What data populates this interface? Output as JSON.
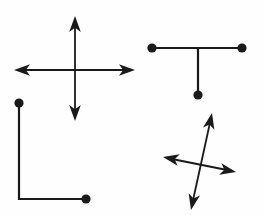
{
  "figure": {
    "title": "Four line-segment figures",
    "background_color": "#fefefe",
    "ink_color": "#1a1a1a",
    "width": 264,
    "height": 215,
    "shapes": [
      {
        "id": "double-arrow-cross",
        "name": "upright-cross-with-four-arrowheads",
        "position": "top-left",
        "stroke_width": 1.8,
        "segments": [
          {
            "name": "vertical-axis",
            "x1": 75,
            "y1": 20,
            "x2": 75,
            "y2": 117
          },
          {
            "name": "horizontal-axis",
            "x1": 18,
            "y1": 70,
            "x2": 131,
            "y2": 70
          }
        ],
        "arrowheads": [
          {
            "name": "arrow-up",
            "tip_x": 75,
            "tip_y": 16,
            "angle": -90
          },
          {
            "name": "arrow-down",
            "tip_x": 75,
            "tip_y": 121,
            "angle": 90
          },
          {
            "name": "arrow-left",
            "tip_x": 14,
            "tip_y": 70,
            "angle": 180
          },
          {
            "name": "arrow-right",
            "tip_x": 135,
            "tip_y": 70,
            "angle": 0
          }
        ],
        "dots": []
      },
      {
        "id": "tee-shape",
        "name": "t-shape-with-three-endpoint-dots",
        "position": "top-right",
        "stroke_width": 2.2,
        "segments": [
          {
            "name": "horizontal-bar",
            "x1": 152,
            "y1": 48,
            "x2": 242,
            "y2": 48
          },
          {
            "name": "vertical-stem",
            "x1": 198,
            "y1": 48,
            "x2": 198,
            "y2": 95
          }
        ],
        "arrowheads": [],
        "dots": [
          {
            "name": "dot-bar-left",
            "cx": 152,
            "cy": 48,
            "r": 4.6
          },
          {
            "name": "dot-bar-right",
            "cx": 242,
            "cy": 48,
            "r": 4.6
          },
          {
            "name": "dot-stem-bottom",
            "cx": 198,
            "cy": 95,
            "r": 4.6
          }
        ]
      },
      {
        "id": "elbow-shape",
        "name": "l-shape-elbow-with-two-endpoint-dots",
        "position": "bottom-left",
        "stroke_width": 2.2,
        "segments": [
          {
            "name": "vertical-leg",
            "x1": 19,
            "y1": 103,
            "x2": 19,
            "y2": 199
          },
          {
            "name": "horizontal-leg",
            "x1": 19,
            "y1": 199,
            "x2": 86,
            "y2": 199
          }
        ],
        "arrowheads": [],
        "dots": [
          {
            "name": "dot-top",
            "cx": 19,
            "cy": 103,
            "r": 4.6
          },
          {
            "name": "dot-right",
            "cx": 86,
            "cy": 199,
            "r": 4.6
          }
        ]
      },
      {
        "id": "rotated-arrow-cross",
        "name": "tilted-cross-with-four-arrowheads",
        "position": "bottom-right",
        "stroke_width": 1.8,
        "segments": [
          {
            "name": "steep-diagonal",
            "x1": 211,
            "y1": 118,
            "x2": 192,
            "y2": 205
          },
          {
            "name": "shallow-diagonal",
            "x1": 167,
            "y1": 158,
            "x2": 232,
            "y2": 171
          }
        ],
        "arrowheads": [
          {
            "name": "arrow-up-right",
            "tip_x": 212,
            "tip_y": 113,
            "angle": -78
          },
          {
            "name": "arrow-down-left",
            "tip_x": 191,
            "tip_y": 210,
            "angle": 102
          },
          {
            "name": "arrow-left-up",
            "tip_x": 163,
            "tip_y": 157,
            "angle": 191
          },
          {
            "name": "arrow-right-down",
            "tip_x": 236,
            "tip_y": 172,
            "angle": 11
          }
        ],
        "dots": []
      }
    ]
  }
}
